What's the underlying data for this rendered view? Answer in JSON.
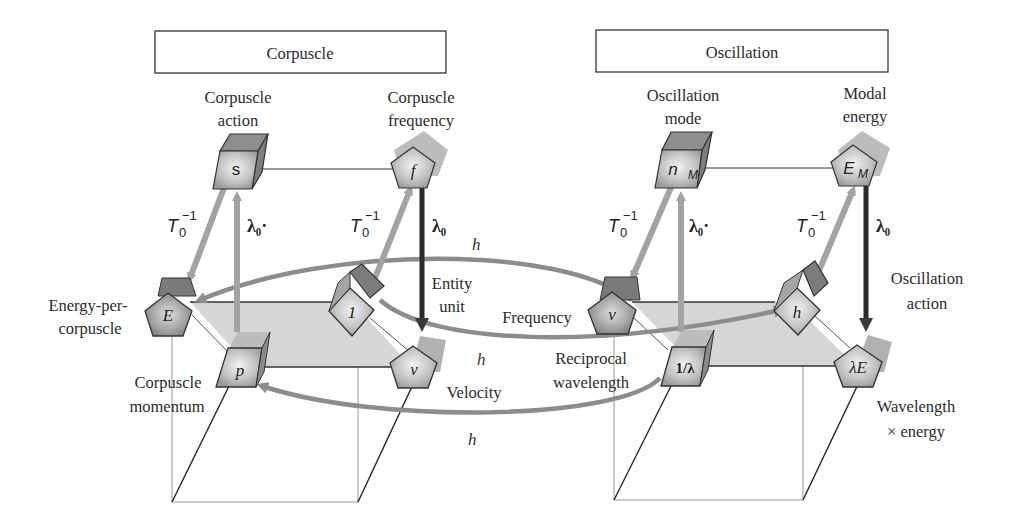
{
  "headers": {
    "left": "Corpuscle",
    "right": "Oscillation"
  },
  "nodes": {
    "corpuscle_action": {
      "symbol": "s",
      "label_line1": "Corpuscle",
      "label_line2": "action"
    },
    "corpuscle_frequency": {
      "symbol": "f",
      "label_line1": "Corpuscle",
      "label_line2": "frequency"
    },
    "energy_per_corpuscle": {
      "symbol": "E",
      "label_line1": "Energy-per-",
      "label_line2": "corpuscle"
    },
    "entity_unit": {
      "symbol": "1",
      "label_line1": "Entity",
      "label_line2": "unit"
    },
    "corpuscle_momentum": {
      "symbol": "p",
      "label_line1": "Corpuscle",
      "label_line2": "momentum"
    },
    "velocity": {
      "symbol": "v",
      "label": "Velocity"
    },
    "oscillation_mode": {
      "symbol": "n",
      "subscript": "M",
      "label_line1": "Oscillation",
      "label_line2": "mode"
    },
    "modal_energy": {
      "symbol": "E",
      "subscript": "M",
      "label_line1": "Modal",
      "label_line2": "energy"
    },
    "frequency": {
      "symbol": "ν",
      "label": "Frequency"
    },
    "oscillation_action": {
      "symbol": "h",
      "label_line1": "Oscillation",
      "label_line2": "action"
    },
    "reciprocal_wavelength": {
      "symbol": "1/λ",
      "label_line1": "Reciprocal",
      "label_line2": "wavelength"
    },
    "wavelength_energy": {
      "symbol": "λE",
      "label_line1": "Wavelength",
      "label_line2": "× energy"
    }
  },
  "operators": {
    "t0_inv": "T",
    "t0_sub": "0",
    "t0_sup": "−1",
    "lambda0_dot": "λ₀·",
    "lambda0": "λ₀",
    "h": "h"
  },
  "colors": {
    "plane_fill": "#d4d4d4",
    "node_fill": "#bdbdbd",
    "node_dark": "#8a8a8a",
    "arrow_light": "#a3a3a3",
    "arrow_mid": "#8c8c8c",
    "arrow_dark": "#2b2b2b"
  }
}
